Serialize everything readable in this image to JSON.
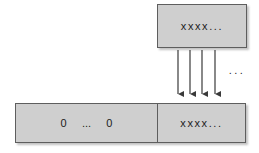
{
  "diagram": {
    "type": "data-copy-diagram",
    "canvas": {
      "width": 259,
      "height": 153,
      "background": "#ffffff"
    },
    "colors": {
      "box_fill": "#cfcfcf",
      "box_border": "#5e5e5e",
      "text": "#1c1c1c",
      "arrow": "#3a3a3a",
      "shadow": "#787878"
    },
    "source_box": {
      "label": "xxxx...",
      "x": 157,
      "y": 4,
      "width": 90,
      "height": 44
    },
    "destination_box": {
      "x": 15,
      "y": 103,
      "width": 231,
      "height": 40,
      "compartments": [
        {
          "name": "zero-padding",
          "label": "0     ...     0",
          "width": 142
        },
        {
          "name": "value-region",
          "label": "xxxx...",
          "width": 88
        }
      ]
    },
    "arrows": {
      "count": 4,
      "direction": "down",
      "ellipsis": "...",
      "positions": [
        {
          "x": 178,
          "y1": 50,
          "y2": 98
        },
        {
          "x": 190,
          "y1": 50,
          "y2": 98
        },
        {
          "x": 202,
          "y1": 50,
          "y2": 98
        },
        {
          "x": 215,
          "y1": 50,
          "y2": 98
        }
      ]
    }
  }
}
